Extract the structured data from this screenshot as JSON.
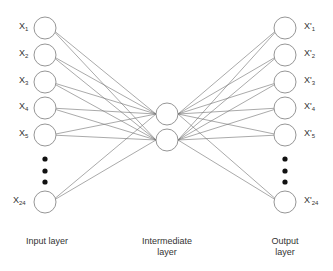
{
  "diagram": {
    "type": "autoencoder-neural-network",
    "input_layer": {
      "caption": "Input layer",
      "nodes": [
        {
          "label": "X",
          "sub": "1"
        },
        {
          "label": "X",
          "sub": "2"
        },
        {
          "label": "X",
          "sub": "3"
        },
        {
          "label": "X",
          "sub": "4"
        },
        {
          "label": "X",
          "sub": "5"
        },
        {
          "label": "X",
          "sub": "24"
        }
      ]
    },
    "intermediate_layer": {
      "caption_line1": "Intermediate",
      "caption_line2": "layer",
      "node_count": 2
    },
    "output_layer": {
      "caption_line1": "Output",
      "caption_line2": "layer",
      "nodes": [
        {
          "label": "X'",
          "sub": "1"
        },
        {
          "label": "X'",
          "sub": "2"
        },
        {
          "label": "X'",
          "sub": "3"
        },
        {
          "label": "X'",
          "sub": "4"
        },
        {
          "label": "X'",
          "sub": "5"
        },
        {
          "label": "X'",
          "sub": "24"
        }
      ]
    },
    "ellipsis": "•••",
    "colors": {
      "node_stroke": "#8a8a8a",
      "edge": "#707070",
      "dots": "#111111",
      "text": "#333333"
    }
  }
}
